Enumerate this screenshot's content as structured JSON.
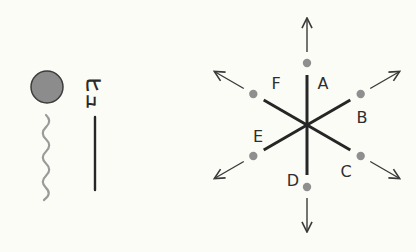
{
  "colors": {
    "background": "#fcfcf7",
    "ball_fill": "#8c8c8c",
    "ball_stroke": "#3c3c3c",
    "wave": "#9a9a9a",
    "line": "#262626",
    "dot": "#8f8f8f",
    "arrow": "#3a3a3a",
    "label": "#2e2e2e"
  },
  "left_panel": {
    "sound_effect": "ヒュ",
    "ball": {
      "cx": 47,
      "cy": 87,
      "r": 16
    },
    "wave": {
      "x": 46,
      "y_start": 115,
      "y_end": 200
    },
    "motion_line": {
      "x": 95,
      "y_start": 117,
      "y_end": 190
    }
  },
  "right_panel": {
    "center": {
      "x": 307,
      "y": 125
    },
    "spokes": [
      {
        "id": "A",
        "label": "A",
        "angle": -90,
        "label_pos": {
          "x": 323,
          "y": 89
        }
      },
      {
        "id": "B",
        "label": "B",
        "angle": -30,
        "label_pos": {
          "x": 362,
          "y": 123
        }
      },
      {
        "id": "C",
        "label": "C",
        "angle": 30,
        "label_pos": {
          "x": 346,
          "y": 177
        }
      },
      {
        "id": "D",
        "label": "D",
        "angle": 90,
        "label_pos": {
          "x": 293,
          "y": 186
        }
      },
      {
        "id": "E",
        "label": "E",
        "angle": 150,
        "label_pos": {
          "x": 258,
          "y": 142
        }
      },
      {
        "id": "F",
        "label": "F",
        "angle": -150,
        "label_pos": {
          "x": 276,
          "y": 89
        }
      }
    ],
    "line_length": 50,
    "dot_distance": 62,
    "arrow_start": 73,
    "arrow_end": 107
  }
}
